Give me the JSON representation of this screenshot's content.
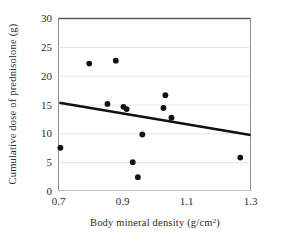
{
  "chart_data": {
    "type": "scatter",
    "title": "",
    "xlabel": "Body mineral density  (g/cm2)",
    "xlabel_main": "Body  mineral  density  (g/cm",
    "xlabel_sup": "2",
    "xlabel_tail": ")",
    "ylabel": "Cumulative  dose of prednisolone  (g)",
    "xlim": [
      0.7,
      1.3
    ],
    "ylim": [
      0,
      30
    ],
    "xticks": [
      "0.7",
      "0.9",
      "1.1",
      "1.3"
    ],
    "xtick_values": [
      0.7,
      0.9,
      1.1,
      1.3
    ],
    "yticks": [
      "0",
      "5",
      "10",
      "15",
      "20",
      "25",
      "30"
    ],
    "ytick_values": [
      0,
      5,
      10,
      15,
      20,
      25,
      30
    ],
    "grid": "horizontal",
    "legend": "none",
    "marker": "filled-circle",
    "marker_color": "#111111",
    "points": [
      {
        "x": 0.706,
        "y": 7.5
      },
      {
        "x": 0.796,
        "y": 22.1
      },
      {
        "x": 0.879,
        "y": 22.6
      },
      {
        "x": 0.853,
        "y": 15.1
      },
      {
        "x": 0.903,
        "y": 14.6
      },
      {
        "x": 0.913,
        "y": 14.2
      },
      {
        "x": 0.962,
        "y": 9.8
      },
      {
        "x": 0.932,
        "y": 5.0
      },
      {
        "x": 0.948,
        "y": 2.4
      },
      {
        "x": 1.034,
        "y": 16.6
      },
      {
        "x": 1.028,
        "y": 14.4
      },
      {
        "x": 1.053,
        "y": 12.7
      },
      {
        "x": 1.268,
        "y": 5.8
      }
    ],
    "trendline": {
      "type": "linear-fit",
      "color": "#111111",
      "x_start": 0.703,
      "y_start": 15.3,
      "x_end": 1.3,
      "y_end": 9.7
    }
  }
}
